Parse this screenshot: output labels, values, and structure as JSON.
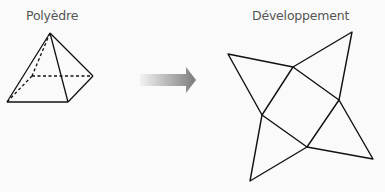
{
  "labels": {
    "polyhedron": "Polyèdre",
    "net": "Développement"
  },
  "icons": {
    "arrow": "right-arrow-icon"
  },
  "colors": {
    "line": "#111111",
    "arrow_dark": "#7a7a7a",
    "arrow_light": "#f0f0f0",
    "label": "#555555",
    "background": "#fafafa"
  }
}
